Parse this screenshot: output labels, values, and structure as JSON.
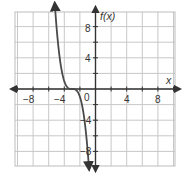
{
  "chart_data": {
    "type": "line",
    "title": "",
    "xlabel": "x",
    "ylabel": "f(x)",
    "xlim": [
      -10,
      10
    ],
    "ylim": [
      -10,
      10
    ],
    "grid": true,
    "grid_step": 2,
    "x_ticks": [
      -8,
      -4,
      0,
      4,
      8
    ],
    "y_ticks": [
      -8,
      -4,
      4,
      8
    ],
    "x_tick_labels": [
      "−8",
      "−4",
      "0",
      "4",
      "8"
    ],
    "y_tick_labels": [
      "−8",
      "−4",
      "4",
      "8"
    ],
    "origin_label": "0",
    "series": [
      {
        "name": "f(x)",
        "description": "decreasing cubic with inflection near (-3, 0), arrows at both ends",
        "x": [
          -5.2,
          -5,
          -4.5,
          -4,
          -3.5,
          -3,
          -2.5,
          -2,
          -1.5,
          -1,
          -0.85
        ],
        "y": [
          9.8,
          8,
          3.4,
          1,
          0.1,
          0,
          -0.1,
          -1,
          -3.4,
          -8,
          -9.9
        ]
      }
    ],
    "legend": "none",
    "colors": {
      "grid": "#c8c8c8",
      "axis": "#333333",
      "curve": "#4a4a4a",
      "frame": "#bdbdbd"
    }
  },
  "labels": {
    "x_axis": "x",
    "y_axis": "f(x)",
    "origin": "0",
    "x_ticks": [
      "−8",
      "−4",
      "4",
      "8"
    ],
    "y_ticks": [
      "8",
      "4",
      "−4",
      "−8"
    ]
  }
}
